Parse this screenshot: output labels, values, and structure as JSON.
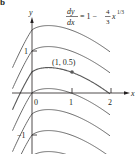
{
  "figure": {
    "panel_label": "b",
    "equation": {
      "numerator": "dy",
      "denominator": "dx",
      "rhs_prefix": "= 1 −",
      "frac_num": "4",
      "frac_den": "3",
      "rhs_var": "x",
      "exponent": "1/3"
    },
    "axes": {
      "x_label": "x",
      "y_label": "y",
      "x_ticks": [
        "0",
        "1",
        "2"
      ],
      "y_ticks": [
        "1",
        "−1"
      ]
    },
    "point": {
      "label": "(1, 0.5)",
      "x": 1,
      "y": 0.5
    },
    "colors": {
      "curve": "#5a5a5a",
      "axis": "#231f20",
      "text": "#231f20"
    }
  },
  "chart_data": {
    "type": "line",
    "xlabel": "x",
    "ylabel": "y",
    "xlim": [
      -0.5,
      2.3
    ],
    "ylim": [
      -1.5,
      1.8
    ],
    "grid": false,
    "family": "y = x − x^(4/3) + C",
    "series": [
      {
        "name": "C = 1.5",
        "C": 1.5
      },
      {
        "name": "C = 1",
        "C": 1
      },
      {
        "name": "C = 0.5",
        "C": 0.5,
        "highlighted": true
      },
      {
        "name": "C = 0",
        "C": 0
      },
      {
        "name": "C = -0.5",
        "C": -0.5
      },
      {
        "name": "C = -1",
        "C": -1
      },
      {
        "name": "C = -1.5",
        "C": -1.5
      }
    ],
    "annotations": [
      {
        "text": "(1, 0.5)",
        "x": 1,
        "y": 0.5
      }
    ]
  }
}
